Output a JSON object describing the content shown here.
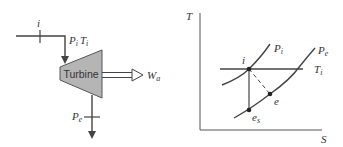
{
  "turbine_diagram": {
    "component_label": "Turbine",
    "inlet_state_label": "i",
    "inlet_props_label_P": "P",
    "inlet_props_sub_P": "i",
    "inlet_props_label_T": "T",
    "inlet_props_sub_T": "i",
    "work_label": "W",
    "work_sub": "a",
    "exit_label": "P",
    "exit_sub": "e",
    "fill_color": "#b5b5b5",
    "line_color": "#444444"
  },
  "ts_diagram": {
    "y_axis_label": "T",
    "x_axis_label": "S",
    "isobars": [
      {
        "label": "P",
        "sub": "i"
      },
      {
        "label": "P",
        "sub": "e"
      }
    ],
    "isotherm": {
      "label": "T",
      "sub": "i"
    },
    "points": [
      {
        "label": "i",
        "sub": ""
      },
      {
        "label": "e",
        "sub": ""
      },
      {
        "label": "e",
        "sub": "s"
      }
    ]
  }
}
